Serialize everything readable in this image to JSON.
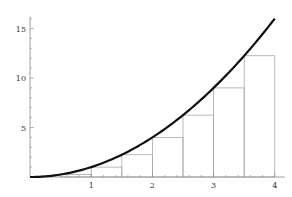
{
  "chart_data": {
    "type": "line",
    "title": "",
    "xlabel": "",
    "ylabel": "",
    "xlim": [
      0,
      4
    ],
    "ylim": [
      0,
      16
    ],
    "grid": false,
    "legend": null,
    "x_ticks": [
      1,
      2,
      3,
      4
    ],
    "y_ticks": [
      5,
      10,
      15
    ],
    "series": [
      {
        "name": "f(x) = x^2",
        "type": "line",
        "function": "x^2",
        "x": [
          0,
          0.5,
          1,
          1.5,
          2,
          2.5,
          3,
          3.5,
          4
        ],
        "values": [
          0,
          0.25,
          1,
          2.25,
          4,
          6.25,
          9,
          12.25,
          16
        ],
        "color": "#111111"
      },
      {
        "name": "left Riemann rectangles",
        "type": "bar",
        "x_left": [
          0,
          0.5,
          1,
          1.5,
          2,
          2.5,
          3,
          3.5
        ],
        "width": 0.5,
        "values": [
          0,
          0.25,
          1,
          2.25,
          4,
          6.25,
          9,
          12.25
        ],
        "color": "#aaaaaa"
      }
    ]
  },
  "colors": {
    "curve": "#111111",
    "rect": "#a8a8a8",
    "axis": "#888888"
  }
}
